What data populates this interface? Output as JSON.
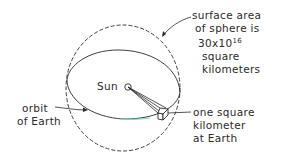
{
  "diagram": {
    "labels": {
      "sun": "Sun",
      "sphere_area": {
        "line1": "surface area",
        "line2": "of sphere is",
        "value_base": "30x10",
        "value_exponent": "16",
        "line4": "square",
        "line5": "kilometers"
      },
      "orbit": {
        "line1": "orbit",
        "line2": "of Earth"
      },
      "unit_area": {
        "line1": "one square",
        "line2": "kilometer",
        "line3": "at Earth"
      }
    },
    "colors": {
      "ink": "#2a2a2a",
      "orbit_highlight": "#7fd3c0",
      "background": "#ffffff"
    }
  }
}
